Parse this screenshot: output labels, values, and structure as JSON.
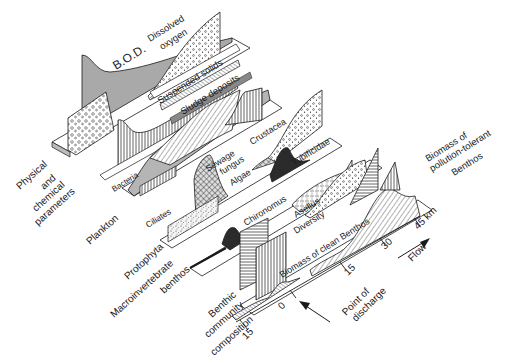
{
  "diagram": {
    "type": "isometric-river-pollution-profile",
    "colors": {
      "ink": "#1a1a1a",
      "grey_fill": "#a9a9a9",
      "dark_fill": "#2b2b2b",
      "background": "#ffffff"
    },
    "group_labels": {
      "physical": [
        "Physical",
        "and",
        "chemical",
        "parameters"
      ],
      "plankton": "Plankton",
      "protophyta": "Protophyta",
      "macroinvertebrate": [
        "Macroinvertebrate",
        "benthos"
      ],
      "benthic": [
        "Benthic",
        "community",
        "composition"
      ]
    },
    "curve_labels": {
      "bod": "B.O.D.",
      "dissolved_oxygen": [
        "Dissolved",
        "oxygen"
      ],
      "suspended_solids": "Suspended solids",
      "sludge_deposits": "Sludge deposits",
      "bacteria": "Bacteria",
      "sewage_fungus": [
        "Sewage",
        "fungus"
      ],
      "crustacea": "Crustacea",
      "ciliates": "Ciliates",
      "algae": "Algae",
      "tubificidae": "Tubificidae",
      "chironomus": "Chironomus",
      "asellus": "Asellus",
      "diversity": "Diversity",
      "biomass_clean": "Biomass of clean Benthos",
      "biomass_tolerant": [
        "Biomass of",
        "pollution-tolerant",
        "Benthos"
      ]
    },
    "axis": {
      "ticks": [
        "15",
        "0",
        "15",
        "30",
        "45 km"
      ],
      "point_of_discharge": [
        "Point of",
        "discharge"
      ],
      "flow": "Flow"
    }
  }
}
